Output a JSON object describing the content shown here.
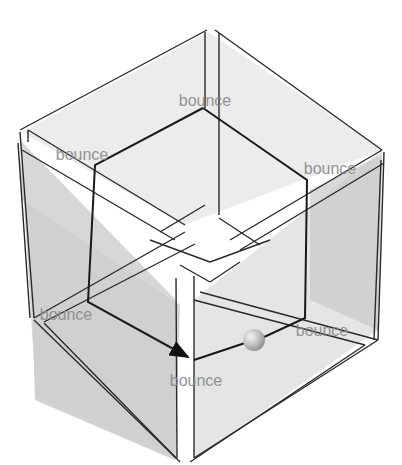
{
  "diagram": {
    "labels": [
      {
        "text": "bounce",
        "x": 205,
        "y": 106
      },
      {
        "text": "bounce",
        "x": 82,
        "y": 160
      },
      {
        "text": "bounce",
        "x": 330,
        "y": 174
      },
      {
        "text": "bounce",
        "x": 66,
        "y": 320
      },
      {
        "text": "bounce",
        "x": 322,
        "y": 336
      },
      {
        "text": "bounce",
        "x": 196,
        "y": 386
      }
    ],
    "colors": {
      "face_light": "#e9e9e9",
      "face_mid": "#d6d6d6",
      "face_dark": "#c4c4c4",
      "edge": "#2a2a2a",
      "label": "#8a8a8a",
      "ball": "#bdbdbd"
    }
  }
}
